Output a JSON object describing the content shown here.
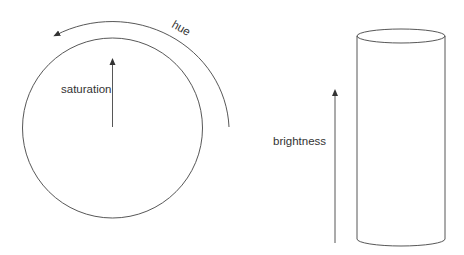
{
  "diagram": {
    "hsb_wheel": {
      "labels": {
        "hue": "hue",
        "saturation": "saturation"
      }
    },
    "cylinder": {
      "labels": {
        "brightness": "brightness"
      }
    },
    "colors": {
      "stroke": "#333333",
      "background": "#ffffff"
    }
  }
}
